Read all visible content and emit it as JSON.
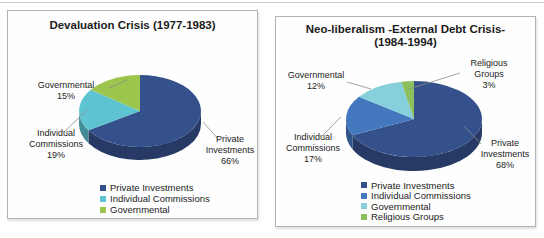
{
  "page": {
    "background": "#ffffff"
  },
  "chart_data": [
    {
      "type": "pie",
      "style": "3d",
      "title": "Devaluation Crisis (1977-1983)",
      "title_lines": [
        "Devaluation Crisis (1977-1983)"
      ],
      "labels": [
        "Private Investments",
        "Individual Commissions",
        "Governmental"
      ],
      "values": [
        66,
        19,
        15
      ],
      "pct_labels": [
        "66%",
        "19%",
        "15%"
      ],
      "colors": [
        "#35518C",
        "#5FC4D1",
        "#9CC54E"
      ],
      "start_angle_deg": -90,
      "direction": "clockwise",
      "legend_position": "bottom"
    },
    {
      "type": "pie",
      "style": "3d",
      "title": "Neo-liberalism -External Debt Crisis- (1984-1994)",
      "title_lines": [
        "Neo-liberalism -External Debt Crisis-",
        "(1984-1994)"
      ],
      "labels": [
        "Private Investments",
        "Individual Commissions",
        "Governmental",
        "Religious Groups"
      ],
      "values": [
        68,
        17,
        12,
        3
      ],
      "pct_labels": [
        "68%",
        "17%",
        "12%",
        "3%"
      ],
      "colors": [
        "#35518C",
        "#4377BE",
        "#85D0DB",
        "#8CC05F"
      ],
      "start_angle_deg": -90,
      "direction": "clockwise",
      "legend_position": "bottom"
    }
  ]
}
